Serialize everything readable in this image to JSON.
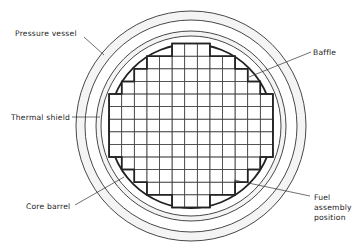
{
  "diagram": {
    "labels": {
      "pressure_vessel": "Pressure vessel",
      "thermal_shield": "Thermal shield",
      "core_barrel": "Core barrel",
      "baffle": "Baffle",
      "fuel_assembly": [
        "Fuel",
        "assembly",
        "position"
      ]
    },
    "core_grid": {
      "rows": 13,
      "columns": 13,
      "row_column_spans": [
        [
          5,
          7
        ],
        [
          3,
          9
        ],
        [
          2,
          10
        ],
        [
          1,
          11
        ],
        [
          0,
          12
        ],
        [
          0,
          12
        ],
        [
          0,
          12
        ],
        [
          0,
          12
        ],
        [
          0,
          12
        ],
        [
          1,
          11
        ],
        [
          2,
          10
        ],
        [
          3,
          9
        ],
        [
          5,
          7
        ]
      ]
    },
    "colors": {
      "line": "#333333",
      "background": "#ffffff",
      "band": "#f4f4f4"
    }
  }
}
